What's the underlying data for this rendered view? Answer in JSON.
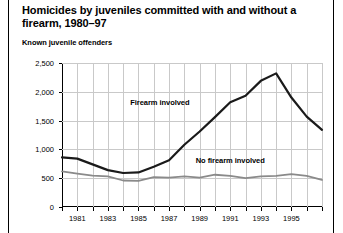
{
  "figure": {
    "title": "Homicides by juveniles committed with and without a firearm, 1980–97",
    "subtitle": "Known juvenile offenders"
  },
  "chart_data": {
    "type": "line",
    "title": "Homicides by juveniles committed with and without a firearm, 1980–97",
    "subtitle": "Known juvenile offenders",
    "xlabel": "",
    "ylabel": "Known juvenile offenders",
    "xlim": [
      1980,
      1997
    ],
    "ylim": [
      0,
      2500
    ],
    "ytick_labels": [
      "0",
      "500",
      "1,000",
      "1,500",
      "2,000",
      "2,500"
    ],
    "ytick_values": [
      0,
      500,
      1000,
      1500,
      2000,
      2500
    ],
    "xtick_values": [
      1980,
      1981,
      1982,
      1983,
      1984,
      1985,
      1986,
      1987,
      1988,
      1989,
      1990,
      1991,
      1992,
      1993,
      1994,
      1995,
      1996,
      1997
    ],
    "xtick_labels": [
      "",
      "1981",
      "",
      "1983",
      "",
      "1985",
      "",
      "1987",
      "",
      "1989",
      "",
      "1991",
      "",
      "1993",
      "",
      "1995",
      "",
      ""
    ],
    "grid": "both",
    "legend_position": "inline-annotation",
    "x": [
      1980,
      1981,
      1982,
      1983,
      1984,
      1985,
      1986,
      1987,
      1988,
      1989,
      1990,
      1991,
      1992,
      1993,
      1994,
      1995,
      1996,
      1997
    ],
    "series": [
      {
        "name": "Firearm involved",
        "color": "#1a1a1a",
        "values": [
          860,
          840,
          740,
          640,
          590,
          600,
          700,
          810,
          1080,
          1310,
          1560,
          1820,
          1930,
          2190,
          2320,
          1900,
          1570,
          1340
        ]
      },
      {
        "name": "No firearm involved",
        "color": "#8a8a8a",
        "values": [
          620,
          580,
          545,
          530,
          460,
          455,
          520,
          510,
          530,
          510,
          560,
          540,
          500,
          530,
          540,
          570,
          540,
          470
        ]
      }
    ],
    "annotations": [
      {
        "text": "Firearm involved",
        "x": 1986.4,
        "y": 1810
      },
      {
        "text": "No firearm involved",
        "x": 1991.0,
        "y": 790
      }
    ]
  }
}
